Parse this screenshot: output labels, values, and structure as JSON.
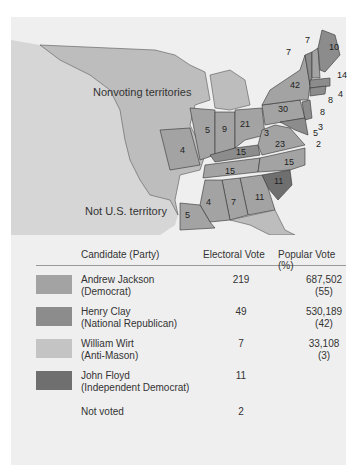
{
  "map": {
    "labels": {
      "nonvoting": "Nonvoting territories",
      "not_us": "Not U.S. territory"
    },
    "colors": {
      "jackson": "#a3a3a3",
      "clay": "#8c8c8c",
      "wirt": "#c4c4c4",
      "floyd": "#6f6f6f",
      "territory": "#bdbdbd",
      "not_us": "#d6d6d6",
      "water": "#f4f4f4"
    },
    "state_votes": [
      {
        "state": "Maine",
        "votes": "10"
      },
      {
        "state": "New Hampshire",
        "votes": "7"
      },
      {
        "state": "Vermont",
        "votes": "7"
      },
      {
        "state": "Massachusetts",
        "votes": "14"
      },
      {
        "state": "Rhode Island",
        "votes": "4"
      },
      {
        "state": "Connecticut",
        "votes": "8"
      },
      {
        "state": "New York",
        "votes": "42"
      },
      {
        "state": "New Jersey",
        "votes": "8"
      },
      {
        "state": "Pennsylvania",
        "votes": "30"
      },
      {
        "state": "Delaware",
        "votes": "3"
      },
      {
        "state": "Maryland",
        "votes": "5"
      },
      {
        "state": "Maryland (split)",
        "votes": "3"
      },
      {
        "state": "Maryland (split 2)",
        "votes": "2"
      },
      {
        "state": "Virginia",
        "votes": "23"
      },
      {
        "state": "Ohio",
        "votes": "21"
      },
      {
        "state": "Indiana",
        "votes": "9"
      },
      {
        "state": "Illinois",
        "votes": "5"
      },
      {
        "state": "Missouri",
        "votes": "4"
      },
      {
        "state": "Kentucky",
        "votes": "15"
      },
      {
        "state": "Tennessee",
        "votes": "15"
      },
      {
        "state": "North Carolina",
        "votes": "15"
      },
      {
        "state": "South Carolina",
        "votes": "11"
      },
      {
        "state": "Georgia",
        "votes": "11"
      },
      {
        "state": "Alabama",
        "votes": "7"
      },
      {
        "state": "Mississippi",
        "votes": "4"
      },
      {
        "state": "Louisiana",
        "votes": "5"
      }
    ]
  },
  "table": {
    "headers": {
      "candidate": "Candidate (Party)",
      "electoral": "Electoral Vote",
      "popular": "Popular Vote (%)"
    },
    "rows": [
      {
        "name": "Andrew Jackson",
        "party": "(Democrat)",
        "electoral": "219",
        "popular": "687,502",
        "percent": "(55)",
        "color": "#a3a3a3"
      },
      {
        "name": "Henry Clay",
        "party": "(National Republican)",
        "electoral": "49",
        "popular": "530,189",
        "percent": "(42)",
        "color": "#8c8c8c"
      },
      {
        "name": "William Wirt",
        "party": "(Anti-Mason)",
        "electoral": "7",
        "popular": "33,108",
        "percent": "(3)",
        "color": "#c4c4c4"
      },
      {
        "name": "John Floyd",
        "party": "(Independent Democrat)",
        "electoral": "11",
        "popular": "",
        "percent": "",
        "color": "#6f6f6f"
      },
      {
        "name": "Not voted",
        "party": "",
        "electoral": "2",
        "popular": "",
        "percent": "",
        "color": ""
      }
    ]
  }
}
